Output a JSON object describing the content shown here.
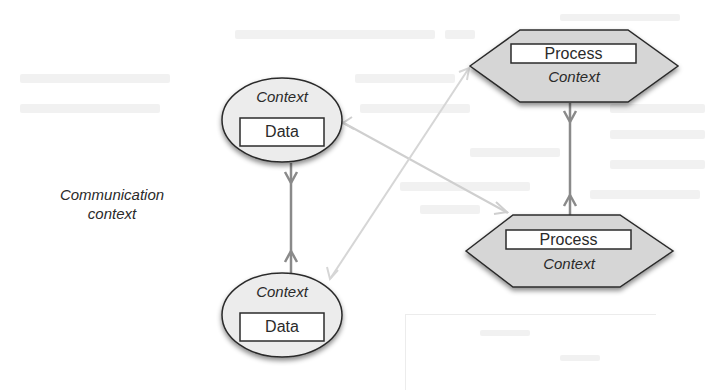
{
  "diagram": {
    "communication_label": {
      "line1": "Communication",
      "line2": "context"
    },
    "nodes": [
      {
        "id": "data-top",
        "shape": "ellipse",
        "context_label": "Context",
        "inner_label": "Data"
      },
      {
        "id": "data-bottom",
        "shape": "ellipse",
        "context_label": "Context",
        "inner_label": "Data"
      },
      {
        "id": "process-top",
        "shape": "hexagon",
        "inner_label": "Process",
        "context_label": "Context"
      },
      {
        "id": "process-bottom",
        "shape": "hexagon",
        "inner_label": "Process",
        "context_label": "Context"
      }
    ],
    "edges": [
      {
        "from": "data-top",
        "to": "data-bottom",
        "style": "dark-gray",
        "bidirectional": true
      },
      {
        "from": "process-top",
        "to": "process-bottom",
        "style": "dark-gray",
        "bidirectional": true
      },
      {
        "from": "data-top",
        "to": "process-bottom",
        "style": "light-gray",
        "bidirectional": true
      },
      {
        "from": "data-bottom",
        "to": "process-top",
        "style": "light-gray",
        "bidirectional": true
      }
    ],
    "colors": {
      "hexagon_fill": "#d6d6d6",
      "ellipse_fill": "#ececec",
      "outline": "#2b2b2b",
      "strong_edge": "#8a8a8a",
      "light_edge": "#cfcfcf",
      "text": "#2a2a2a"
    }
  }
}
